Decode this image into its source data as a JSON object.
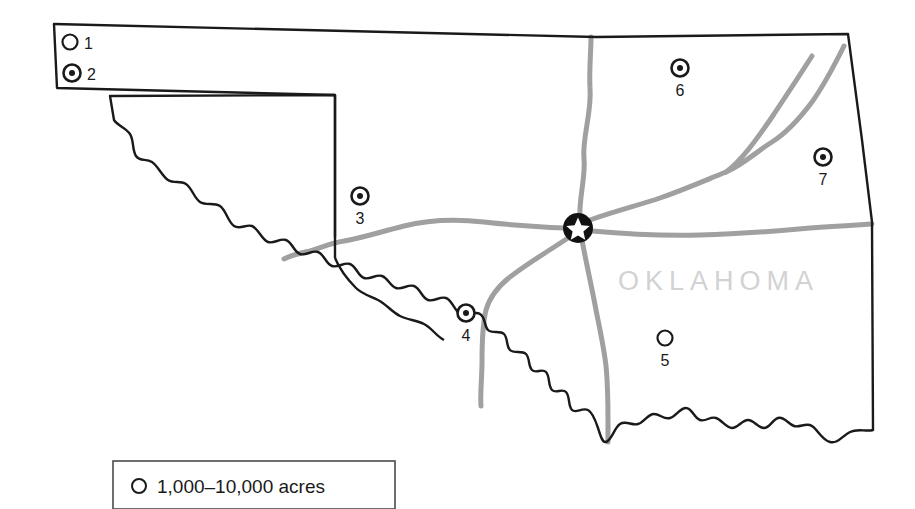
{
  "map": {
    "state_label": "OKLAHOMA",
    "state_label_color": "#d2d2d2",
    "outline_color": "#1a1a1a",
    "road_color": "#a0a0a0",
    "background_color": "#ffffff",
    "capital_marker": {
      "name": "capital-star-marker",
      "x": 578,
      "y": 228,
      "symbol": "star-in-circle",
      "fill": "#111111",
      "star_fill": "#ffffff"
    },
    "markers": [
      {
        "id": "1",
        "label": "1",
        "type": "open-circle",
        "x": 70,
        "y": 42,
        "label_x": 86,
        "label_y": 48
      },
      {
        "id": "2",
        "label": "2",
        "type": "dot-circle",
        "x": 72,
        "y": 73,
        "label_x": 89,
        "label_y": 79
      },
      {
        "id": "3",
        "label": "3",
        "type": "dot-circle",
        "x": 360,
        "y": 196,
        "label_x": 360,
        "label_y": 221
      },
      {
        "id": "4",
        "label": "4",
        "type": "dot-circle",
        "x": 466,
        "y": 313,
        "label_x": 466,
        "label_y": 338
      },
      {
        "id": "5",
        "label": "5",
        "type": "open-circle",
        "x": 665,
        "y": 338,
        "label_x": 665,
        "label_y": 363
      },
      {
        "id": "6",
        "label": "6",
        "type": "dot-circle",
        "x": 680,
        "y": 68,
        "label_x": 680,
        "label_y": 93
      },
      {
        "id": "7",
        "label": "7",
        "type": "dot-circle",
        "x": 823,
        "y": 157,
        "label_x": 823,
        "label_y": 182
      }
    ]
  },
  "legend": {
    "name": "legend-box",
    "symbol": "open-circle",
    "text": "1,000–10,000 acres"
  }
}
